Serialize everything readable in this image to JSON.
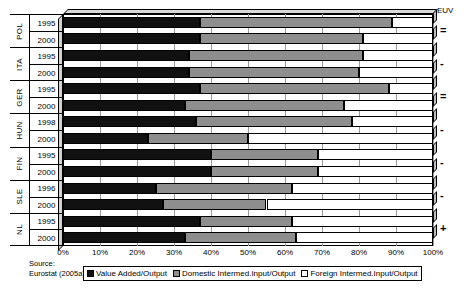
{
  "chart_data": {
    "type": "bar",
    "orientation": "horizontal",
    "stacked": true,
    "title": "",
    "xlabel": "",
    "ylabel": "",
    "xlim": [
      0,
      100
    ],
    "xticks": [
      "0%",
      "10%",
      "20%",
      "30%",
      "40%",
      "50%",
      "60%",
      "70%",
      "80%",
      "90%",
      "100%"
    ],
    "grid": true,
    "legend_position": "bottom",
    "series": [
      {
        "name": "Value Added/Output",
        "key": "va",
        "color": "#111111",
        "values": [
          37,
          37,
          34,
          34,
          37,
          33,
          36,
          23,
          40,
          40,
          25,
          27,
          37,
          33
        ]
      },
      {
        "name": "Domestic Intermed.Input/Output",
        "key": "di",
        "color": "#8e8e8e",
        "values": [
          52,
          44,
          47,
          46,
          51,
          43,
          42,
          27,
          29,
          29,
          37,
          28,
          25,
          30
        ]
      },
      {
        "name": "Foreign Intermed.Input/Output",
        "key": "fi",
        "color": "#ffffff",
        "values": [
          11,
          19,
          19,
          20,
          12,
          24,
          22,
          50,
          31,
          31,
          38,
          45,
          38,
          37
        ]
      }
    ],
    "categories": [
      {
        "country": "POL",
        "year": "1995"
      },
      {
        "country": "POL",
        "year": "2000"
      },
      {
        "country": "ITA",
        "year": "1995"
      },
      {
        "country": "ITA",
        "year": "2000"
      },
      {
        "country": "GER",
        "year": "1995"
      },
      {
        "country": "GER",
        "year": "2000"
      },
      {
        "country": "HUN",
        "year": "1998"
      },
      {
        "country": "HUN",
        "year": "2000"
      },
      {
        "country": "FIN",
        "year": "1995"
      },
      {
        "country": "FIN",
        "year": "2000"
      },
      {
        "country": "SLE",
        "year": "1996"
      },
      {
        "country": "SLE",
        "year": "2000"
      },
      {
        "country": "NL",
        "year": "1995"
      },
      {
        "country": "NL",
        "year": "2000"
      }
    ],
    "groups": [
      {
        "country": "POL",
        "years": [
          "1995",
          "2000"
        ],
        "euv": "="
      },
      {
        "country": "ITA",
        "years": [
          "1995",
          "2000"
        ],
        "euv": "-"
      },
      {
        "country": "GER",
        "years": [
          "1995",
          "2000"
        ],
        "euv": "="
      },
      {
        "country": "HUN",
        "years": [
          "1998",
          "2000"
        ],
        "euv": "-"
      },
      {
        "country": "FIN",
        "years": [
          "1995",
          "2000"
        ],
        "euv": "-"
      },
      {
        "country": "SLE",
        "years": [
          "1996",
          "2000"
        ],
        "euv": "-"
      },
      {
        "country": "NL",
        "years": [
          "1995",
          "2000"
        ],
        "euv": "+"
      }
    ],
    "annotations": {
      "euv_header": "EUV"
    }
  },
  "footer": {
    "source_line1": "Source:",
    "source_line2": "Eurostat (2005a)"
  }
}
